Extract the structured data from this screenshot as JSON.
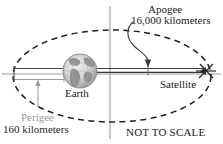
{
  "figure": {
    "note": "NOT TO SCALE",
    "labels": {
      "apogee_name": "Apogee",
      "apogee_distance": "16,000 kilometers",
      "perigee_name": "Perigee",
      "perigee_distance": "160 kilometers",
      "earth": "Earth",
      "satellite": "Satellite"
    },
    "colors": {
      "orbit_dash": "#1f1f1f",
      "axis": "#9b9b9b",
      "measure_line": "#3a3a3a",
      "text_dark": "#1a1a1a",
      "text_gray": "#9a9a9a",
      "globe_light": "#e6e6e6",
      "globe_mid": "#bdbdbd",
      "globe_dark": "#8a8a8a",
      "background": "#ffffff"
    },
    "geometry": {
      "orbit_center_x": 112,
      "orbit_center_y": 76,
      "orbit_radius_x": 99,
      "orbit_radius_y": 46,
      "earth_center_x": 80,
      "earth_center_y": 71,
      "earth_radius": 17,
      "satellite_x": 207,
      "satellite_y": 74,
      "axis_vertical_x": 110,
      "axis_horizontal_y": 74
    },
    "icons": {
      "globe": "earth-globe-icon",
      "satellite": "satellite-icon",
      "arrow": "curved-arrow-icon"
    }
  }
}
